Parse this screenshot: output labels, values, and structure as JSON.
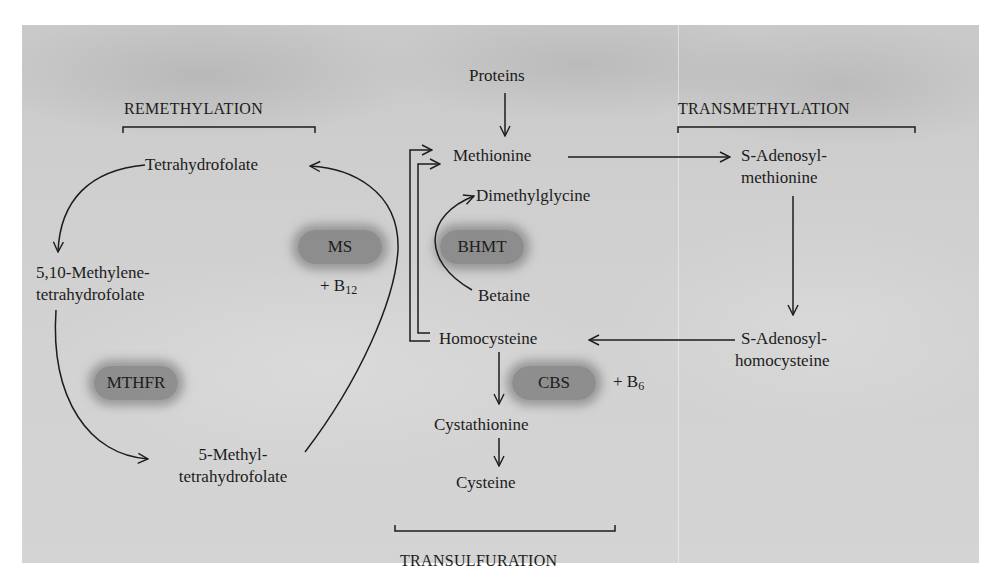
{
  "diagram": {
    "sections": {
      "remethylation": "REMETHYLATION",
      "transmethylation": "TRANSMETHYLATION",
      "transsulfuration": "TRANSULFURATION"
    },
    "metabolites": {
      "proteins": "Proteins",
      "methionine": "Methionine",
      "dimethylglycine": "Dimethylglycine",
      "betaine": "Betaine",
      "homocysteine": "Homocysteine",
      "cystathionine": "Cystathionine",
      "cysteine": "Cysteine",
      "sam_line1": "S-Adenosyl-",
      "sam_line2": "methionine",
      "sah_line1": "S-Adenosyl-",
      "sah_line2": "homocysteine",
      "thf": "Tetrahydrofolate",
      "methylene_thf_line1": "5,10-Methylene-",
      "methylene_thf_line2": "tetrahydrofolate",
      "methyl_thf_line1": "5-Methyl-",
      "methyl_thf_line2": "tetrahydrofolate"
    },
    "enzymes": {
      "ms": "MS",
      "bhmt": "BHMT",
      "mthfr": "MTHFR",
      "cbs": "CBS"
    },
    "cofactors": {
      "ms_prefix": "+ B",
      "ms_sub": "12",
      "cbs_prefix": "+ B",
      "cbs_sub": "6"
    },
    "colors": {
      "background": "#cfcfcf",
      "enzyme_blob": "#6e6e6e",
      "ink": "#1c1c1c"
    }
  }
}
